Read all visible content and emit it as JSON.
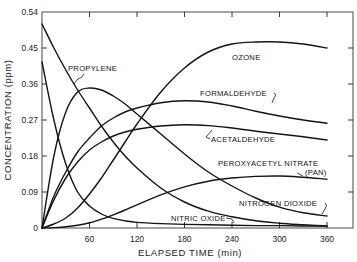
{
  "chart_data": {
    "type": "line",
    "title": "",
    "xlabel": "ELAPSED TIME (min)",
    "ylabel": "CONCENTRATION (ppm)",
    "xlim": [
      0,
      360
    ],
    "ylim": [
      0,
      0.54
    ],
    "grid": false,
    "legend_position": "inline annotations",
    "x_ticks": [
      "60",
      "120",
      "180",
      "240",
      "300",
      "360"
    ],
    "y_ticks": [
      "0",
      "0.09",
      "0.18",
      "0.27",
      "0.36",
      "0.45",
      "0.54"
    ],
    "x": [
      0,
      15,
      30,
      45,
      60,
      75,
      90,
      105,
      120,
      150,
      180,
      210,
      240,
      270,
      300,
      330,
      360
    ],
    "series": [
      {
        "name": "PROPYLENE",
        "values": [
          0.51,
          0.45,
          0.395,
          0.345,
          0.3,
          0.255,
          0.215,
          0.18,
          0.15,
          0.1,
          0.065,
          0.042,
          0.028,
          0.018,
          0.012,
          0.008,
          0.005
        ]
      },
      {
        "name": "NITRIC OXIDE",
        "values": [
          0.415,
          0.27,
          0.16,
          0.09,
          0.055,
          0.035,
          0.024,
          0.018,
          0.014,
          0.011,
          0.009,
          0.008,
          0.007,
          0.006,
          0.006,
          0.005,
          0.005
        ]
      },
      {
        "name": "NITROGEN DIOXIDE",
        "values": [
          0.0,
          0.18,
          0.29,
          0.34,
          0.35,
          0.345,
          0.33,
          0.31,
          0.285,
          0.235,
          0.185,
          0.14,
          0.105,
          0.075,
          0.052,
          0.038,
          0.03
        ]
      },
      {
        "name": "OZONE",
        "values": [
          0.0,
          0.01,
          0.025,
          0.05,
          0.085,
          0.125,
          0.17,
          0.215,
          0.26,
          0.34,
          0.4,
          0.44,
          0.46,
          0.465,
          0.465,
          0.46,
          0.45
        ]
      },
      {
        "name": "FORMALDEHYDE",
        "values": [
          0.0,
          0.08,
          0.14,
          0.19,
          0.225,
          0.255,
          0.275,
          0.29,
          0.3,
          0.313,
          0.318,
          0.315,
          0.305,
          0.292,
          0.28,
          0.27,
          0.262
        ]
      },
      {
        "name": "ACETALDEHYDE",
        "values": [
          0.0,
          0.07,
          0.125,
          0.165,
          0.195,
          0.215,
          0.23,
          0.24,
          0.247,
          0.255,
          0.258,
          0.256,
          0.25,
          0.242,
          0.235,
          0.228,
          0.22
        ]
      },
      {
        "name": "PEROXYACETYL NITRATE (PAN)",
        "values": [
          0.0,
          0.001,
          0.003,
          0.007,
          0.013,
          0.022,
          0.033,
          0.045,
          0.058,
          0.083,
          0.103,
          0.117,
          0.125,
          0.129,
          0.13,
          0.127,
          0.122
        ]
      }
    ],
    "annotations": [
      {
        "text": "OZONE",
        "series": "OZONE"
      },
      {
        "text": "PROPYLENE",
        "series": "PROPYLENE"
      },
      {
        "text": "FORMALDEHYDE",
        "series": "FORMALDEHYDE"
      },
      {
        "text": "ACETALDEHYDE",
        "series": "ACETALDEHYDE"
      },
      {
        "text": "PEROXYACETYL NITRATE",
        "series": "PEROXYACETYL NITRATE (PAN)"
      },
      {
        "text": "(PAN)",
        "series": "PEROXYACETYL NITRATE (PAN)"
      },
      {
        "text": "NITROGEN DIOXIDE",
        "series": "NITROGEN DIOXIDE"
      },
      {
        "text": "NITRIC OXIDE",
        "series": "NITRIC OXIDE"
      }
    ]
  },
  "labels": {
    "ozone": "OZONE",
    "propylene": "PROPYLENE",
    "formaldehyde": "FORMALDEHYDE",
    "acetaldehyde": "ACETALDEHYDE",
    "pan_line1": "PEROXYACETYL NITRATE",
    "pan_line2": "(PAN)",
    "no2": "NITROGEN DIOXIDE",
    "no": "NITRIC OXIDE"
  },
  "axes": {
    "xlabel": "ELAPSED TIME (min)",
    "ylabel": "CONCENTRATION (ppm)",
    "x_ticks": [
      "0",
      "60",
      "120",
      "180",
      "240",
      "300",
      "360"
    ],
    "y_ticks": [
      "0",
      "0.09",
      "0.18",
      "0.27",
      "0.36",
      "0.45",
      "0.54"
    ]
  },
  "colors": {
    "ink": "#141414",
    "background": "#ffffff"
  }
}
